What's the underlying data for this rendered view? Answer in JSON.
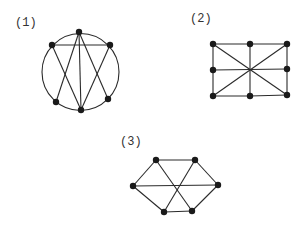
{
  "figure": {
    "background": "#ffffff",
    "edge_color": "#2a2a2a",
    "node_color": "#1a1a1a",
    "graphs": [
      {
        "label": "(1)",
        "label_pos": [
          15,
          26
        ],
        "circle": {
          "cx": 80.5,
          "cy": 72,
          "r": 38.5
        },
        "nodes": [
          [
            79,
            32
          ],
          [
            52,
            45
          ],
          [
            110,
            45
          ],
          [
            56,
            102
          ],
          [
            108,
            99
          ],
          [
            81,
            110
          ]
        ],
        "edges": [
          [
            1,
            2
          ],
          [
            0,
            5
          ],
          [
            0,
            3
          ],
          [
            0,
            4
          ],
          [
            1,
            5
          ],
          [
            2,
            5
          ]
        ]
      },
      {
        "label": "(2)",
        "label_pos": [
          190,
          22
        ],
        "nodes": [
          [
            213,
            44
          ],
          [
            250,
            44
          ],
          [
            287,
            44
          ],
          [
            213,
            70
          ],
          [
            287,
            69
          ],
          [
            213,
            96
          ],
          [
            250,
            96
          ],
          [
            287,
            95
          ]
        ],
        "edges": [
          [
            0,
            1
          ],
          [
            1,
            2
          ],
          [
            0,
            3
          ],
          [
            3,
            5
          ],
          [
            2,
            4
          ],
          [
            4,
            7
          ],
          [
            5,
            6
          ],
          [
            6,
            7
          ],
          [
            3,
            4
          ],
          [
            1,
            6
          ],
          [
            0,
            7
          ],
          [
            2,
            5
          ]
        ]
      },
      {
        "label": "(3)",
        "label_pos": [
          120,
          145
        ],
        "nodes": [
          [
            156,
            160
          ],
          [
            195,
            160
          ],
          [
            133,
            186
          ],
          [
            218,
            185
          ],
          [
            164,
            212
          ],
          [
            192,
            211
          ]
        ],
        "edges": [
          [
            0,
            1
          ],
          [
            0,
            2
          ],
          [
            1,
            3
          ],
          [
            2,
            4
          ],
          [
            3,
            5
          ],
          [
            4,
            5
          ],
          [
            2,
            3
          ],
          [
            0,
            5
          ],
          [
            1,
            4
          ]
        ]
      }
    ]
  }
}
